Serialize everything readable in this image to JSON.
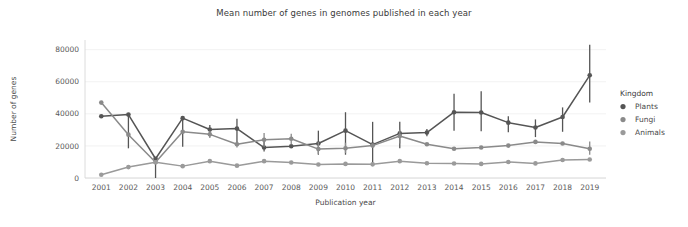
{
  "chart_data": {
    "type": "line",
    "title": "Mean number of genes in genomes published in each year",
    "xlabel": "Publication year",
    "ylabel": "Number of genes",
    "categories": [
      "2001",
      "2002",
      "2003",
      "2004",
      "2005",
      "2006",
      "2007",
      "2008",
      "2009",
      "2010",
      "2011",
      "2012",
      "2013",
      "2014",
      "2015",
      "2016",
      "2017",
      "2018",
      "2019"
    ],
    "x": [
      2001,
      2002,
      2003,
      2004,
      2005,
      2006,
      2007,
      2008,
      2009,
      2010,
      2011,
      2012,
      2013,
      2014,
      2015,
      2016,
      2017,
      2018,
      2019
    ],
    "xlim": [
      2000.4,
      2019.6
    ],
    "ylim": [
      0,
      86000
    ],
    "yticks": [
      0,
      20000,
      40000,
      60000,
      80000
    ],
    "ytick_labels": [
      "0",
      "20000",
      "40000",
      "60000",
      "80000"
    ],
    "grid": "horizontal",
    "legend_position": "right",
    "legend_title": "Kingdom",
    "series": [
      {
        "name": "Plants",
        "color": "#555555",
        "values": [
          38500,
          39500,
          12000,
          37300,
          30200,
          30800,
          19000,
          19800,
          21500,
          29500,
          20800,
          27800,
          28300,
          41000,
          40800,
          34500,
          31500,
          38000,
          64000
        ],
        "err_low": [
          38500,
          18500,
          0,
          19500,
          26000,
          20500,
          16500,
          19800,
          14500,
          14500,
          8500,
          18500,
          26000,
          29500,
          29200,
          28500,
          25500,
          28800,
          47000
        ],
        "err_high": [
          38500,
          39900,
          12800,
          37300,
          33000,
          37000,
          25000,
          19800,
          29500,
          41000,
          35000,
          35000,
          30500,
          52500,
          54000,
          38500,
          36500,
          44000,
          83000
        ]
      },
      {
        "name": "Fungi",
        "color": "#8a8a8a",
        "values": [
          47000,
          27000,
          9800,
          28800,
          27200,
          21000,
          23800,
          24500,
          18000,
          18500,
          20200,
          26200,
          21000,
          18200,
          19000,
          20200,
          22500,
          21500,
          18200
        ],
        "err_low": [
          47000,
          27000,
          9800,
          28800,
          25000,
          19000,
          19500,
          21000,
          15000,
          15500,
          19200,
          21500,
          21000,
          18200,
          19000,
          20200,
          22500,
          21500,
          14500
        ],
        "err_high": [
          47000,
          27000,
          9800,
          28800,
          29500,
          23000,
          28000,
          27500,
          22500,
          22000,
          21500,
          30000,
          21000,
          18200,
          19000,
          20200,
          22500,
          21500,
          22800
        ]
      },
      {
        "name": "Animals",
        "color": "#9a9a9a",
        "values": [
          2000,
          6800,
          9800,
          7400,
          10500,
          7700,
          10500,
          9700,
          8400,
          8800,
          8500,
          10500,
          9200,
          9000,
          8800,
          10000,
          9100,
          11200,
          11500
        ],
        "err_low": [
          2000,
          6800,
          9800,
          7400,
          10500,
          7700,
          10500,
          9700,
          8400,
          8800,
          8500,
          10500,
          9200,
          9000,
          8800,
          10000,
          9100,
          11200,
          11500
        ],
        "err_high": [
          2000,
          6800,
          9800,
          7400,
          10500,
          7700,
          10500,
          9700,
          8400,
          8800,
          8500,
          10500,
          9200,
          9000,
          8800,
          10000,
          9100,
          11200,
          11500
        ]
      }
    ]
  },
  "legend": {
    "title": "Kingdom",
    "items": [
      {
        "label": "Plants",
        "color": "#555555"
      },
      {
        "label": "Fungi",
        "color": "#8a8a8a"
      },
      {
        "label": "Animals",
        "color": "#9a9a9a"
      }
    ]
  }
}
